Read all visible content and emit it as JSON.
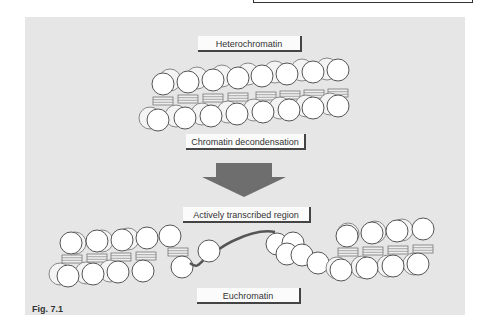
{
  "figure": {
    "caption": "Fig. 7.1",
    "labels": {
      "top": "Heterochromatin",
      "process": "Chromatin decondensation",
      "region": "Actively transcribed region",
      "bottom": "Euchromatin"
    },
    "colors": {
      "panel_bg": "#e6e6e6",
      "nucleosome_fill": "#ffffff",
      "nucleosome_stroke": "#555555",
      "arrow_fill": "#6e6e6e",
      "dna_stroke": "#555555"
    }
  }
}
